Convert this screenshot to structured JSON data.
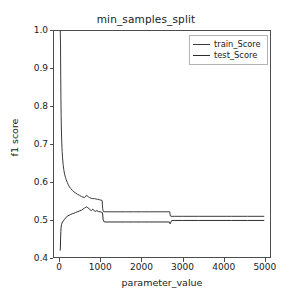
{
  "chart_data": {
    "type": "line",
    "title": "min_samples_split",
    "xlabel": "parameter_value",
    "ylabel": "f1 score",
    "xlim": [
      -150,
      5150
    ],
    "ylim": [
      0.4,
      1.0
    ],
    "grid": false,
    "legend_position": "upper right",
    "xticks": [
      0,
      1000,
      2000,
      3000,
      4000,
      5000
    ],
    "xtick_labels": [
      "0",
      "1000",
      "2000",
      "3000",
      "4000",
      "5000"
    ],
    "yticks": [
      0.4,
      0.5,
      0.6,
      0.7,
      0.8,
      0.9,
      1.0
    ],
    "ytick_labels": [
      "0.4",
      "0.5",
      "0.6",
      "0.7",
      "0.8",
      "0.9",
      "1.0"
    ],
    "series": [
      {
        "name": "train_Score",
        "color": "#3a3a3a",
        "x": [
          2,
          5,
          10,
          15,
          20,
          25,
          30,
          40,
          50,
          60,
          75,
          90,
          110,
          130,
          150,
          175,
          200,
          230,
          260,
          300,
          340,
          380,
          420,
          470,
          520,
          560,
          600,
          630,
          660,
          690,
          720,
          760,
          800,
          840,
          880,
          920,
          960,
          1000,
          1030,
          1045,
          1060,
          1100,
          1200,
          1400,
          1600,
          1800,
          2000,
          2200,
          2400,
          2600,
          2690,
          2705,
          2720,
          2800,
          3000,
          3400,
          3800,
          4200,
          4600,
          5000
        ],
        "values": [
          1.0,
          1.0,
          0.96,
          0.88,
          0.82,
          0.775,
          0.745,
          0.705,
          0.68,
          0.663,
          0.645,
          0.632,
          0.62,
          0.612,
          0.605,
          0.598,
          0.592,
          0.586,
          0.582,
          0.577,
          0.573,
          0.57,
          0.567,
          0.564,
          0.561,
          0.559,
          0.558,
          0.562,
          0.563,
          0.56,
          0.558,
          0.556,
          0.555,
          0.555,
          0.554,
          0.553,
          0.552,
          0.551,
          0.55,
          0.528,
          0.521,
          0.52,
          0.52,
          0.52,
          0.52,
          0.52,
          0.52,
          0.52,
          0.52,
          0.52,
          0.52,
          0.509,
          0.508,
          0.508,
          0.508,
          0.508,
          0.508,
          0.508,
          0.508,
          0.508
        ]
      },
      {
        "name": "test_Score",
        "color": "#2b2b2b",
        "x": [
          2,
          6,
          12,
          18,
          25,
          35,
          45,
          60,
          80,
          100,
          130,
          160,
          190,
          220,
          260,
          300,
          340,
          380,
          420,
          470,
          520,
          560,
          600,
          630,
          655,
          680,
          710,
          740,
          770,
          800,
          830,
          860,
          900,
          940,
          980,
          1010,
          1040,
          1055,
          1075,
          1100,
          1200,
          1400,
          1600,
          1800,
          2000,
          2200,
          2400,
          2600,
          2680,
          2700,
          2715,
          2740,
          2800,
          3000,
          3400,
          3800,
          4200,
          4600,
          5000
        ],
        "values": [
          0.418,
          0.424,
          0.45,
          0.468,
          0.479,
          0.486,
          0.49,
          0.493,
          0.496,
          0.499,
          0.503,
          0.507,
          0.509,
          0.511,
          0.513,
          0.515,
          0.516,
          0.518,
          0.52,
          0.522,
          0.524,
          0.527,
          0.53,
          0.532,
          0.533,
          0.531,
          0.528,
          0.525,
          0.523,
          0.527,
          0.524,
          0.521,
          0.523,
          0.521,
          0.52,
          0.519,
          0.518,
          0.5,
          0.494,
          0.493,
          0.493,
          0.493,
          0.493,
          0.493,
          0.493,
          0.493,
          0.493,
          0.493,
          0.493,
          0.488,
          0.492,
          0.497,
          0.497,
          0.497,
          0.497,
          0.497,
          0.497,
          0.497,
          0.497
        ]
      }
    ]
  },
  "legend": {
    "items": [
      {
        "label": "train_Score"
      },
      {
        "label": "test_Score"
      }
    ]
  }
}
